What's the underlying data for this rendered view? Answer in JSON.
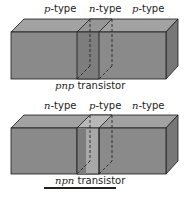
{
  "diagrams": [
    {
      "name": "pnp",
      "regions": [
        {
          "prefix": "p",
          "suffix": "-type"
        },
        {
          "prefix": "n",
          "suffix": "-type"
        },
        {
          "prefix": "p",
          "suffix": "-type"
        }
      ],
      "caption": {
        "prefix": "pnp",
        "suffix": " transistor"
      }
    },
    {
      "name": "npn",
      "regions": [
        {
          "prefix": "n",
          "suffix": "-type"
        },
        {
          "prefix": "p",
          "suffix": "-type"
        },
        {
          "prefix": "n",
          "suffix": "-type"
        }
      ],
      "caption": {
        "prefix": "npn",
        "suffix": " transistor"
      }
    }
  ],
  "colors": {
    "front": "#8a8a8a",
    "top": "#a2a2a2",
    "side": "#777777",
    "middle_front": "#7a7a7a",
    "middle_top": "#b5b5b5",
    "edge": "#1a1a1a"
  }
}
